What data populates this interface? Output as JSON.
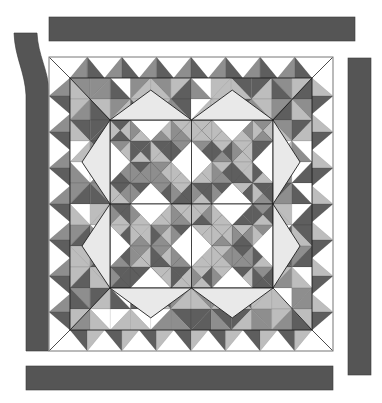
{
  "diagram": {
    "palette": {
      "background": "#ffffff",
      "strip": "#555555",
      "strip_edge": "#3a3a3a",
      "white": "#ffffff",
      "pale": "#e9e9e9",
      "light": "#bdbdbd",
      "mid": "#8e8e8e",
      "dark": "#5e5e5e",
      "outline": "#1e1e1e",
      "quilt_edge": "#9a9a9a"
    },
    "strips": [
      {
        "name": "top-border-strip",
        "side": "top"
      },
      {
        "name": "left-border-strip",
        "side": "left",
        "shape": "curved-top"
      },
      {
        "name": "right-border-strip",
        "side": "right"
      },
      {
        "name": "bottom-border-strip",
        "side": "bottom"
      }
    ],
    "quilt": {
      "outer_border": "sawtooth half-square triangles, gray points on white",
      "inner_border": "mixed gray half-square triangles",
      "setting_triangles": "large pale gray triangles around center",
      "center": {
        "rows": 2,
        "cols": 2,
        "block_grid": 4,
        "block_description": "Pinwheel-style blocks of gray half-square triangles with white diamond accents"
      },
      "sawtooth_count_per_side": 7
    }
  }
}
